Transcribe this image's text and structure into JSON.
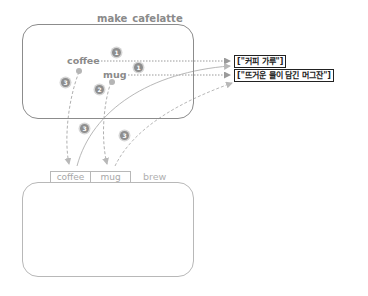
{
  "outer_function": {
    "name": "make_cafelatte",
    "variables": [
      {
        "name": "coffee",
        "value": "[\"커피 가루\"]"
      },
      {
        "name": "mug",
        "value": "[\"뜨거운 물이 담긴 머그잔\"]"
      }
    ]
  },
  "inner_function": {
    "name": "brew",
    "params": [
      "coffee",
      "mug"
    ]
  },
  "badges": {
    "coffee_to_value": "1",
    "mug_to_value": "1",
    "mug_to_param": "2",
    "coffee_to_param": "3",
    "param_coffee_to_value": "3",
    "param_mug_to_value": "3"
  },
  "colors": {
    "stroke": "#8c8c8c",
    "stroke_light": "#b8b8b8",
    "value_border": "#222222"
  }
}
